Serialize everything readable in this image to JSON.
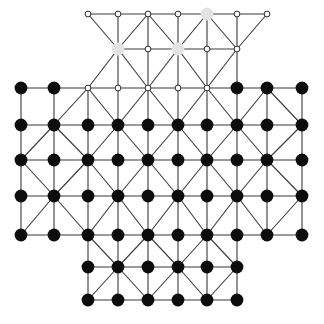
{
  "figure": {
    "title": "",
    "background_color": "#ffffff",
    "width": 324,
    "height": 324,
    "type": "lattice-graph-diagram"
  },
  "style": {
    "edge_color": "#3a3a3a",
    "edge_width": 1.1,
    "filled_node_color": "#0d0d0d",
    "filled_node_radius": 6.4,
    "open_node_fill": "#ffffff",
    "open_node_stroke": "#2b2b2b",
    "open_node_radius": 2.9,
    "open_node_stroke_width": 1.0,
    "highlight_node_color": "#e3e3e3",
    "highlight_node_radius": 6.4
  },
  "geometry": {
    "columns_x": [
      21,
      54,
      88,
      118,
      148,
      178,
      207,
      237,
      267,
      302
    ],
    "rows_y": [
      14,
      49,
      88,
      125,
      160,
      196,
      235,
      267,
      300
    ],
    "note": "column index 0..9 maps to x, row index 0..8 maps to y"
  },
  "graph_data": {
    "type": "lattice",
    "node_states": [
      "filled",
      "open",
      "highlight"
    ],
    "counts": {
      "filled": 57,
      "open": 17,
      "highlight": 3,
      "total": 77
    },
    "nodes": [
      {
        "id": "r0c2",
        "col": 2,
        "row": 0,
        "state": "open"
      },
      {
        "id": "r0c3",
        "col": 3,
        "row": 0,
        "state": "open"
      },
      {
        "id": "r0c4",
        "col": 4,
        "row": 0,
        "state": "open"
      },
      {
        "id": "r0c5",
        "col": 5,
        "row": 0,
        "state": "open"
      },
      {
        "id": "r0c6",
        "col": 6,
        "row": 0,
        "state": "highlight"
      },
      {
        "id": "r0c7",
        "col": 7,
        "row": 0,
        "state": "open"
      },
      {
        "id": "r0c8",
        "col": 8,
        "row": 0,
        "state": "open"
      },
      {
        "id": "r1c3",
        "col": 3,
        "row": 1,
        "state": "highlight"
      },
      {
        "id": "r1c4",
        "col": 4,
        "row": 1,
        "state": "open"
      },
      {
        "id": "r1c5",
        "col": 5,
        "row": 1,
        "state": "highlight"
      },
      {
        "id": "r1c6",
        "col": 6,
        "row": 1,
        "state": "open"
      },
      {
        "id": "r1c7",
        "col": 7,
        "row": 1,
        "state": "open"
      },
      {
        "id": "r2c0",
        "col": 0,
        "row": 2,
        "state": "filled"
      },
      {
        "id": "r2c1",
        "col": 1,
        "row": 2,
        "state": "filled"
      },
      {
        "id": "r2c2",
        "col": 2,
        "row": 2,
        "state": "open"
      },
      {
        "id": "r2c3",
        "col": 3,
        "row": 2,
        "state": "open"
      },
      {
        "id": "r2c4",
        "col": 4,
        "row": 2,
        "state": "open"
      },
      {
        "id": "r2c5",
        "col": 5,
        "row": 2,
        "state": "open"
      },
      {
        "id": "r2c6",
        "col": 6,
        "row": 2,
        "state": "open"
      },
      {
        "id": "r2c7",
        "col": 7,
        "row": 2,
        "state": "filled"
      },
      {
        "id": "r2c8",
        "col": 8,
        "row": 2,
        "state": "filled"
      },
      {
        "id": "r2c9",
        "col": 9,
        "row": 2,
        "state": "filled"
      },
      {
        "id": "r3c0",
        "col": 0,
        "row": 3,
        "state": "filled"
      },
      {
        "id": "r3c1",
        "col": 1,
        "row": 3,
        "state": "filled"
      },
      {
        "id": "r3c2",
        "col": 2,
        "row": 3,
        "state": "filled"
      },
      {
        "id": "r3c3",
        "col": 3,
        "row": 3,
        "state": "filled"
      },
      {
        "id": "r3c4",
        "col": 4,
        "row": 3,
        "state": "filled"
      },
      {
        "id": "r3c5",
        "col": 5,
        "row": 3,
        "state": "filled"
      },
      {
        "id": "r3c6",
        "col": 6,
        "row": 3,
        "state": "filled"
      },
      {
        "id": "r3c7",
        "col": 7,
        "row": 3,
        "state": "filled"
      },
      {
        "id": "r3c8",
        "col": 8,
        "row": 3,
        "state": "filled"
      },
      {
        "id": "r3c9",
        "col": 9,
        "row": 3,
        "state": "filled"
      },
      {
        "id": "r4c0",
        "col": 0,
        "row": 4,
        "state": "filled"
      },
      {
        "id": "r4c1",
        "col": 1,
        "row": 4,
        "state": "filled"
      },
      {
        "id": "r4c2",
        "col": 2,
        "row": 4,
        "state": "filled"
      },
      {
        "id": "r4c3",
        "col": 3,
        "row": 4,
        "state": "filled"
      },
      {
        "id": "r4c4",
        "col": 4,
        "row": 4,
        "state": "filled"
      },
      {
        "id": "r4c5",
        "col": 5,
        "row": 4,
        "state": "filled"
      },
      {
        "id": "r4c6",
        "col": 6,
        "row": 4,
        "state": "filled"
      },
      {
        "id": "r4c7",
        "col": 7,
        "row": 4,
        "state": "filled"
      },
      {
        "id": "r4c8",
        "col": 8,
        "row": 4,
        "state": "filled"
      },
      {
        "id": "r4c9",
        "col": 9,
        "row": 4,
        "state": "filled"
      },
      {
        "id": "r5c0",
        "col": 0,
        "row": 5,
        "state": "filled"
      },
      {
        "id": "r5c1",
        "col": 1,
        "row": 5,
        "state": "filled"
      },
      {
        "id": "r5c2",
        "col": 2,
        "row": 5,
        "state": "filled"
      },
      {
        "id": "r5c3",
        "col": 3,
        "row": 5,
        "state": "filled"
      },
      {
        "id": "r5c4",
        "col": 4,
        "row": 5,
        "state": "filled"
      },
      {
        "id": "r5c5",
        "col": 5,
        "row": 5,
        "state": "filled"
      },
      {
        "id": "r5c6",
        "col": 6,
        "row": 5,
        "state": "filled"
      },
      {
        "id": "r5c7",
        "col": 7,
        "row": 5,
        "state": "filled"
      },
      {
        "id": "r5c8",
        "col": 8,
        "row": 5,
        "state": "filled"
      },
      {
        "id": "r5c9",
        "col": 9,
        "row": 5,
        "state": "filled"
      },
      {
        "id": "r6c0",
        "col": 0,
        "row": 6,
        "state": "filled"
      },
      {
        "id": "r6c1",
        "col": 1,
        "row": 6,
        "state": "filled"
      },
      {
        "id": "r6c2",
        "col": 2,
        "row": 6,
        "state": "filled"
      },
      {
        "id": "r6c3",
        "col": 3,
        "row": 6,
        "state": "filled"
      },
      {
        "id": "r6c4",
        "col": 4,
        "row": 6,
        "state": "filled"
      },
      {
        "id": "r6c5",
        "col": 5,
        "row": 6,
        "state": "filled"
      },
      {
        "id": "r6c6",
        "col": 6,
        "row": 6,
        "state": "filled"
      },
      {
        "id": "r6c7",
        "col": 7,
        "row": 6,
        "state": "filled"
      },
      {
        "id": "r6c8",
        "col": 8,
        "row": 6,
        "state": "filled"
      },
      {
        "id": "r6c9",
        "col": 9,
        "row": 6,
        "state": "filled"
      },
      {
        "id": "r7c2",
        "col": 2,
        "row": 7,
        "state": "filled"
      },
      {
        "id": "r7c3",
        "col": 3,
        "row": 7,
        "state": "filled"
      },
      {
        "id": "r7c4",
        "col": 4,
        "row": 7,
        "state": "filled"
      },
      {
        "id": "r7c5",
        "col": 5,
        "row": 7,
        "state": "filled"
      },
      {
        "id": "r7c6",
        "col": 6,
        "row": 7,
        "state": "filled"
      },
      {
        "id": "r7c7",
        "col": 7,
        "row": 7,
        "state": "filled"
      },
      {
        "id": "r8c2",
        "col": 2,
        "row": 8,
        "state": "filled"
      },
      {
        "id": "r8c3",
        "col": 3,
        "row": 8,
        "state": "filled"
      },
      {
        "id": "r8c4",
        "col": 4,
        "row": 8,
        "state": "filled"
      },
      {
        "id": "r8c5",
        "col": 5,
        "row": 8,
        "state": "filled"
      },
      {
        "id": "r8c6",
        "col": 6,
        "row": 8,
        "state": "filled"
      },
      {
        "id": "r8c7",
        "col": 7,
        "row": 8,
        "state": "filled"
      }
    ],
    "edges": [
      [
        "r0c2",
        "r0c3"
      ],
      [
        "r0c3",
        "r0c4"
      ],
      [
        "r0c4",
        "r0c5"
      ],
      [
        "r0c5",
        "r0c6"
      ],
      [
        "r0c6",
        "r0c7"
      ],
      [
        "r0c7",
        "r0c8"
      ],
      [
        "r1c3",
        "r1c4"
      ],
      [
        "r1c4",
        "r1c5"
      ],
      [
        "r1c5",
        "r1c6"
      ],
      [
        "r1c6",
        "r1c7"
      ],
      [
        "r2c0",
        "r2c1"
      ],
      [
        "r2c1",
        "r2c2"
      ],
      [
        "r2c2",
        "r2c3"
      ],
      [
        "r2c3",
        "r2c4"
      ],
      [
        "r2c4",
        "r2c5"
      ],
      [
        "r2c5",
        "r2c6"
      ],
      [
        "r2c6",
        "r2c7"
      ],
      [
        "r2c7",
        "r2c8"
      ],
      [
        "r2c8",
        "r2c9"
      ],
      [
        "r3c0",
        "r3c1"
      ],
      [
        "r3c1",
        "r3c2"
      ],
      [
        "r3c2",
        "r3c3"
      ],
      [
        "r3c3",
        "r3c4"
      ],
      [
        "r3c4",
        "r3c5"
      ],
      [
        "r3c5",
        "r3c6"
      ],
      [
        "r3c6",
        "r3c7"
      ],
      [
        "r3c7",
        "r3c8"
      ],
      [
        "r3c8",
        "r3c9"
      ],
      [
        "r4c0",
        "r4c1"
      ],
      [
        "r4c1",
        "r4c2"
      ],
      [
        "r4c2",
        "r4c3"
      ],
      [
        "r4c3",
        "r4c4"
      ],
      [
        "r4c4",
        "r4c5"
      ],
      [
        "r4c5",
        "r4c6"
      ],
      [
        "r4c6",
        "r4c7"
      ],
      [
        "r4c7",
        "r4c8"
      ],
      [
        "r4c8",
        "r4c9"
      ],
      [
        "r5c0",
        "r5c1"
      ],
      [
        "r5c1",
        "r5c2"
      ],
      [
        "r5c2",
        "r5c3"
      ],
      [
        "r5c3",
        "r5c4"
      ],
      [
        "r5c4",
        "r5c5"
      ],
      [
        "r5c5",
        "r5c6"
      ],
      [
        "r5c6",
        "r5c7"
      ],
      [
        "r5c7",
        "r5c8"
      ],
      [
        "r5c8",
        "r5c9"
      ],
      [
        "r6c0",
        "r6c1"
      ],
      [
        "r6c1",
        "r6c2"
      ],
      [
        "r6c2",
        "r6c3"
      ],
      [
        "r6c3",
        "r6c4"
      ],
      [
        "r6c4",
        "r6c5"
      ],
      [
        "r6c5",
        "r6c6"
      ],
      [
        "r6c6",
        "r6c7"
      ],
      [
        "r6c7",
        "r6c8"
      ],
      [
        "r6c8",
        "r6c9"
      ],
      [
        "r7c2",
        "r7c3"
      ],
      [
        "r7c3",
        "r7c4"
      ],
      [
        "r7c4",
        "r7c5"
      ],
      [
        "r7c5",
        "r7c6"
      ],
      [
        "r7c6",
        "r7c7"
      ],
      [
        "r8c2",
        "r8c3"
      ],
      [
        "r8c3",
        "r8c4"
      ],
      [
        "r8c4",
        "r8c5"
      ],
      [
        "r8c5",
        "r8c6"
      ],
      [
        "r8c6",
        "r8c7"
      ],
      [
        "r0c3",
        "r1c3"
      ],
      [
        "r0c4",
        "r1c4"
      ],
      [
        "r0c5",
        "r1c5"
      ],
      [
        "r0c6",
        "r1c6"
      ],
      [
        "r0c7",
        "r1c7"
      ],
      [
        "r1c3",
        "r2c3"
      ],
      [
        "r1c4",
        "r2c4"
      ],
      [
        "r1c5",
        "r2c5"
      ],
      [
        "r1c6",
        "r2c6"
      ],
      [
        "r1c7",
        "r2c7"
      ],
      [
        "r2c0",
        "r3c0"
      ],
      [
        "r2c1",
        "r3c1"
      ],
      [
        "r2c2",
        "r3c2"
      ],
      [
        "r2c3",
        "r3c3"
      ],
      [
        "r2c4",
        "r3c4"
      ],
      [
        "r2c5",
        "r3c5"
      ],
      [
        "r2c6",
        "r3c6"
      ],
      [
        "r2c7",
        "r3c7"
      ],
      [
        "r2c8",
        "r3c8"
      ],
      [
        "r2c9",
        "r3c9"
      ],
      [
        "r3c0",
        "r4c0"
      ],
      [
        "r3c1",
        "r4c1"
      ],
      [
        "r3c2",
        "r4c2"
      ],
      [
        "r3c3",
        "r4c3"
      ],
      [
        "r3c4",
        "r4c4"
      ],
      [
        "r3c5",
        "r4c5"
      ],
      [
        "r3c6",
        "r4c6"
      ],
      [
        "r3c7",
        "r4c7"
      ],
      [
        "r3c8",
        "r4c8"
      ],
      [
        "r3c9",
        "r4c9"
      ],
      [
        "r4c0",
        "r5c0"
      ],
      [
        "r4c1",
        "r5c1"
      ],
      [
        "r4c2",
        "r5c2"
      ],
      [
        "r4c3",
        "r5c3"
      ],
      [
        "r4c4",
        "r5c4"
      ],
      [
        "r4c5",
        "r5c5"
      ],
      [
        "r4c6",
        "r5c6"
      ],
      [
        "r4c7",
        "r5c7"
      ],
      [
        "r4c8",
        "r5c8"
      ],
      [
        "r4c9",
        "r5c9"
      ],
      [
        "r5c0",
        "r6c0"
      ],
      [
        "r5c1",
        "r6c1"
      ],
      [
        "r5c2",
        "r6c2"
      ],
      [
        "r5c3",
        "r6c3"
      ],
      [
        "r5c4",
        "r6c4"
      ],
      [
        "r5c5",
        "r6c5"
      ],
      [
        "r5c6",
        "r6c6"
      ],
      [
        "r5c7",
        "r6c7"
      ],
      [
        "r5c8",
        "r6c8"
      ],
      [
        "r5c9",
        "r6c9"
      ],
      [
        "r6c2",
        "r7c2"
      ],
      [
        "r6c3",
        "r7c3"
      ],
      [
        "r6c4",
        "r7c4"
      ],
      [
        "r6c5",
        "r7c5"
      ],
      [
        "r6c6",
        "r7c6"
      ],
      [
        "r6c7",
        "r7c7"
      ],
      [
        "r7c2",
        "r8c2"
      ],
      [
        "r7c3",
        "r8c3"
      ],
      [
        "r7c4",
        "r8c4"
      ],
      [
        "r7c5",
        "r8c5"
      ],
      [
        "r7c6",
        "r8c6"
      ],
      [
        "r7c7",
        "r8c7"
      ],
      [
        "r0c2",
        "r1c3"
      ],
      [
        "r0c4",
        "r1c3"
      ],
      [
        "r0c4",
        "r1c5"
      ],
      [
        "r0c6",
        "r1c5"
      ],
      [
        "r0c6",
        "r1c7"
      ],
      [
        "r0c8",
        "r1c7"
      ],
      [
        "r1c3",
        "r2c2"
      ],
      [
        "r1c3",
        "r2c4"
      ],
      [
        "r1c5",
        "r2c4"
      ],
      [
        "r1c5",
        "r2c6"
      ],
      [
        "r1c7",
        "r2c6"
      ],
      [
        "r2c2",
        "r3c1"
      ],
      [
        "r2c2",
        "r3c3"
      ],
      [
        "r2c4",
        "r3c3"
      ],
      [
        "r2c4",
        "r3c5"
      ],
      [
        "r2c6",
        "r3c5"
      ],
      [
        "r2c6",
        "r3c7"
      ],
      [
        "r2c8",
        "r3c7"
      ],
      [
        "r2c8",
        "r3c9"
      ],
      [
        "r3c1",
        "r4c0"
      ],
      [
        "r3c1",
        "r4c2"
      ],
      [
        "r3c3",
        "r4c2"
      ],
      [
        "r3c3",
        "r4c4"
      ],
      [
        "r3c5",
        "r4c4"
      ],
      [
        "r3c5",
        "r4c6"
      ],
      [
        "r3c7",
        "r4c6"
      ],
      [
        "r3c7",
        "r4c8"
      ],
      [
        "r3c9",
        "r4c8"
      ],
      [
        "r4c0",
        "r5c1"
      ],
      [
        "r4c2",
        "r5c1"
      ],
      [
        "r4c2",
        "r5c3"
      ],
      [
        "r4c4",
        "r5c3"
      ],
      [
        "r4c4",
        "r5c5"
      ],
      [
        "r4c6",
        "r5c5"
      ],
      [
        "r4c6",
        "r5c7"
      ],
      [
        "r4c8",
        "r5c7"
      ],
      [
        "r4c8",
        "r5c9"
      ],
      [
        "r5c1",
        "r6c0"
      ],
      [
        "r5c1",
        "r6c2"
      ],
      [
        "r5c3",
        "r6c2"
      ],
      [
        "r5c3",
        "r6c4"
      ],
      [
        "r5c5",
        "r6c4"
      ],
      [
        "r5c5",
        "r6c6"
      ],
      [
        "r5c7",
        "r6c6"
      ],
      [
        "r5c7",
        "r6c8"
      ],
      [
        "r5c9",
        "r6c8"
      ],
      [
        "r6c2",
        "r7c3"
      ],
      [
        "r6c4",
        "r7c3"
      ],
      [
        "r6c4",
        "r7c5"
      ],
      [
        "r6c6",
        "r7c5"
      ],
      [
        "r6c6",
        "r7c7"
      ],
      [
        "r7c3",
        "r8c2"
      ],
      [
        "r7c3",
        "r8c4"
      ],
      [
        "r7c5",
        "r8c4"
      ],
      [
        "r7c5",
        "r8c6"
      ],
      [
        "r7c7",
        "r8c6"
      ]
    ]
  }
}
